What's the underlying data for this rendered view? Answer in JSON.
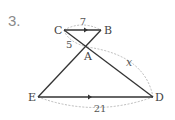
{
  "problem": {
    "number": "3."
  },
  "figure": {
    "points": {
      "C": {
        "label": "C"
      },
      "B": {
        "label": "B"
      },
      "A": {
        "label": "A"
      },
      "E": {
        "label": "E"
      },
      "D": {
        "label": "D"
      }
    },
    "segments": [
      {
        "from": "C",
        "to": "B",
        "parallel_marker": true
      },
      {
        "from": "E",
        "to": "D",
        "parallel_marker": true
      },
      {
        "from": "C",
        "to": "D"
      },
      {
        "from": "B",
        "to": "E"
      }
    ],
    "measurements": {
      "CB": "7",
      "CA": "5",
      "AD": "x",
      "ED": "21"
    },
    "colors": {
      "line": "#333333",
      "dashed": "#aaaaaa",
      "text": "#444444"
    }
  }
}
